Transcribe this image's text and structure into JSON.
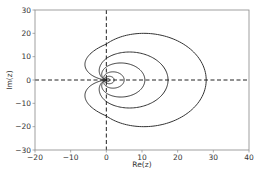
{
  "chart_data": {
    "type": "line",
    "title": "",
    "xlabel": "Re(z)",
    "ylabel": "Im(z)",
    "xlim": [
      -20,
      40
    ],
    "ylim": [
      -30,
      30
    ],
    "xticks": [
      -20,
      -10,
      0,
      10,
      20,
      30,
      40
    ],
    "yticks": [
      -30,
      -20,
      -10,
      0,
      10,
      20,
      30
    ],
    "xtick_labels": [
      "−20",
      "−10",
      "0",
      "10",
      "20",
      "30",
      "40"
    ],
    "ytick_labels": [
      "−30",
      "−20",
      "−10",
      "0",
      "10",
      "20",
      "30"
    ],
    "grid": false,
    "legend": null,
    "reference_lines": [
      {
        "orientation": "horizontal",
        "value": 0,
        "style": "dashed"
      },
      {
        "orientation": "vertical",
        "value": 0,
        "style": "dashed"
      }
    ],
    "series": [
      {
        "name": "curve-1",
        "shape": "cardioid",
        "re_max": 28,
        "re_min": -6,
        "im_max": 20
      },
      {
        "name": "curve-2",
        "shape": "cardioid",
        "re_max": 17.3,
        "re_min": -2,
        "im_max": 12
      },
      {
        "name": "curve-3",
        "shape": "cardioid",
        "re_max": 10.8,
        "re_min": -1.3,
        "im_max": 7.3
      },
      {
        "name": "curve-4",
        "shape": "cardioid",
        "re_max": 5,
        "re_min": -0.7,
        "im_max": 3.5
      },
      {
        "name": "curve-5",
        "shape": "cardioid",
        "re_max": 2.2,
        "re_min": -0.4,
        "im_max": 1.6
      },
      {
        "name": "curve-6",
        "shape": "cardioid",
        "re_max": 1,
        "re_min": -0.2,
        "im_max": 0.7
      }
    ],
    "line_color": "#333333"
  }
}
